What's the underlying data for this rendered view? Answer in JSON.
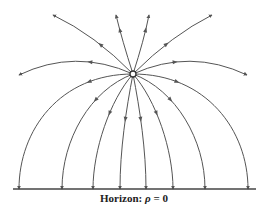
{
  "diagram": {
    "type": "field-lines",
    "source_point": {
      "x": 133,
      "y": 74,
      "label": ""
    },
    "line_color": "#555555",
    "horizon": {
      "y": 189,
      "x1": 13,
      "x2": 256,
      "label_prefix": "Horizon: ",
      "label_symbol": "ρ",
      "label_suffix": " = 0"
    },
    "upper_lines": [
      {
        "name": "far-left-up",
        "d": "M133,74 Q95,35 53,15",
        "arrow": [
          101,
          43
        ]
      },
      {
        "name": "left-up",
        "d": "M133,74 Q122,40 116,15",
        "arrow": [
          120,
          30
        ]
      },
      {
        "name": "right-up",
        "d": "M133,74 Q144,40 149,15",
        "arrow": [
          145,
          30
        ]
      },
      {
        "name": "far-right-up",
        "d": "M133,74 Q172,35 212,15",
        "arrow": [
          164,
          41
        ]
      },
      {
        "name": "left-side",
        "d": "M133,74 Q75,48 19,75",
        "arrow": [
          90,
          62
        ]
      },
      {
        "name": "right-side",
        "d": "M133,74 Q190,48 247,75",
        "arrow": [
          175,
          61
        ]
      }
    ],
    "lower_lines": [
      {
        "name": "arc-1",
        "d": "M133,74 C60,74 19,130 19,189",
        "arrow": [
          89,
          82
        ]
      },
      {
        "name": "arc-2",
        "d": "M133,74 C90,90 62,140 62,189",
        "arrow": [
          96,
          101
        ]
      },
      {
        "name": "arc-3",
        "d": "M133,74 C110,100 93,150 93,189",
        "arrow": [
          110,
          114
        ]
      },
      {
        "name": "arc-4",
        "d": "M133,74 C126,110 120,150 120,189",
        "arrow": [
          125,
          119
        ]
      },
      {
        "name": "arc-5",
        "d": "M133,74 C140,110 146,150 146,189",
        "arrow": [
          141,
          119
        ]
      },
      {
        "name": "arc-6",
        "d": "M133,74 C156,100 173,150 173,189",
        "arrow": [
          156,
          113
        ]
      },
      {
        "name": "arc-7",
        "d": "M133,74 C176,90 205,140 205,189",
        "arrow": [
          170,
          100
        ]
      },
      {
        "name": "arc-8",
        "d": "M133,74 C206,74 248,130 248,189",
        "arrow": [
          177,
          82
        ]
      }
    ]
  }
}
